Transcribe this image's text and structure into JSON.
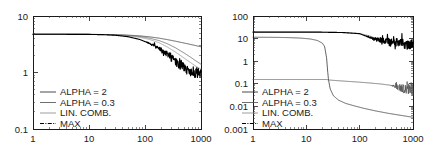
{
  "figure": {
    "background": "#ffffff",
    "panel_count": 2,
    "axis_color": "#1a1a1a"
  },
  "chart_data": [
    {
      "type": "line",
      "panel": "left",
      "title": "",
      "xlabel": "",
      "ylabel": "",
      "xscale": "log",
      "yscale": "log",
      "xlim": [
        1,
        1000
      ],
      "ylim": [
        0.1,
        10
      ],
      "xticks": [
        1,
        10,
        100,
        1000
      ],
      "xticklabels": [
        "1",
        "10",
        "100",
        "1000"
      ],
      "yticks": [
        0.1,
        1,
        10
      ],
      "yticklabels": [
        "0.1",
        "1",
        "10"
      ],
      "grid": false,
      "legend_position": "lower-left",
      "series": [
        {
          "name": "ALPHA = 2",
          "color": "#2b2b2b",
          "style": "solid",
          "x": [
            1,
            2,
            3,
            5,
            8,
            12,
            20,
            30,
            50,
            80,
            120,
            180,
            250,
            350,
            500,
            650,
            800,
            1000
          ],
          "y": [
            4.75,
            4.75,
            4.75,
            4.74,
            4.73,
            4.72,
            4.7,
            4.66,
            4.58,
            4.45,
            4.28,
            4.05,
            3.82,
            3.58,
            3.32,
            3.14,
            3.0,
            2.85
          ]
        },
        {
          "name": "ALPHA = 0.3",
          "color": "#555555",
          "style": "solid",
          "x": [
            1,
            2,
            3,
            5,
            8,
            12,
            20,
            30,
            50,
            80,
            120,
            180,
            250,
            350,
            500,
            650,
            800,
            1000
          ],
          "y": [
            4.75,
            4.75,
            4.75,
            4.74,
            4.73,
            4.72,
            4.69,
            4.64,
            4.52,
            4.33,
            4.06,
            3.66,
            3.23,
            2.74,
            2.21,
            1.87,
            1.62,
            1.4
          ]
        },
        {
          "name": "LIN. COMB.",
          "color": "#8c8c8c",
          "style": "solid",
          "x": [
            1,
            2,
            3,
            5,
            8,
            12,
            20,
            30,
            50,
            80,
            120,
            180,
            250,
            350,
            500,
            650,
            800,
            1000
          ],
          "y": [
            4.75,
            4.75,
            4.75,
            4.74,
            4.73,
            4.71,
            4.68,
            4.61,
            4.46,
            4.2,
            3.85,
            3.35,
            2.83,
            2.3,
            1.8,
            1.5,
            1.3,
            1.15
          ]
        },
        {
          "name": "MAX",
          "color": "#000000",
          "style": "noisy",
          "x": [
            1,
            2,
            3,
            5,
            8,
            12,
            20,
            30,
            50,
            80,
            110,
            150,
            200,
            260,
            330,
            420,
            520,
            640,
            780,
            900,
            1000
          ],
          "y": [
            4.75,
            4.75,
            4.75,
            4.74,
            4.73,
            4.71,
            4.66,
            4.56,
            4.3,
            3.85,
            3.4,
            2.9,
            2.4,
            2.0,
            1.62,
            1.33,
            1.14,
            1.02,
            0.95,
            0.93,
            0.95
          ],
          "noise_start_x": 100,
          "noise_amplitude": 0.16
        }
      ]
    },
    {
      "type": "line",
      "panel": "right",
      "title": "",
      "xlabel": "",
      "ylabel": "",
      "xscale": "log",
      "yscale": "log",
      "xlim": [
        1,
        1000
      ],
      "ylim": [
        0.001,
        100
      ],
      "xticks": [
        1,
        10,
        100,
        1000
      ],
      "xticklabels": [
        "1",
        "10",
        "100",
        "1000"
      ],
      "yticks": [
        0.001,
        0.01,
        0.1,
        1,
        10,
        100
      ],
      "yticklabels": [
        "0.001",
        "0.01",
        "0.1",
        "1",
        "10",
        "100"
      ],
      "grid": false,
      "legend_position": "lower-left",
      "series": [
        {
          "name": "ALPHA = 2",
          "color": "#2b2b2b",
          "style": "solid",
          "x": [
            1,
            2,
            3,
            5,
            8,
            12,
            16,
            20,
            22,
            24,
            25,
            26,
            28,
            32,
            40,
            55,
            80,
            120,
            200,
            350,
            600,
            1000
          ],
          "y": [
            11.5,
            11.4,
            11.3,
            11.0,
            10.5,
            9.6,
            8.3,
            6.3,
            4.5,
            1.4,
            0.4,
            0.155,
            0.06,
            0.03,
            0.019,
            0.0135,
            0.0105,
            0.0082,
            0.0063,
            0.0049,
            0.004,
            0.0033
          ]
        },
        {
          "name": "ALPHA = 0.3",
          "color": "#555555",
          "style": "noisy",
          "x": [
            1,
            5,
            12,
            20,
            24,
            25,
            26,
            30,
            40,
            60,
            100,
            160,
            250,
            380,
            520,
            680,
            850,
            1000
          ],
          "y": [
            0.155,
            0.155,
            0.155,
            0.155,
            0.155,
            0.152,
            0.148,
            0.144,
            0.137,
            0.128,
            0.118,
            0.108,
            0.098,
            0.086,
            0.072,
            0.06,
            0.052,
            0.048
          ],
          "noise_start_x": 380,
          "noise_amplitude": 0.5
        },
        {
          "name": "LIN. COMB.",
          "color": "#8c8c8c",
          "style": "solid",
          "x": [
            1,
            3,
            8,
            20,
            50,
            100,
            150,
            200,
            300,
            450,
            650,
            1000
          ],
          "y": [
            19.5,
            19.5,
            19.4,
            19.2,
            18.5,
            16.8,
            13.5,
            10.5,
            8.0,
            6.6,
            5.8,
            5.2
          ]
        },
        {
          "name": "MAX",
          "color": "#000000",
          "style": "noisy",
          "x": [
            1,
            3,
            8,
            20,
            50,
            100,
            130,
            170,
            230,
            320,
            450,
            620,
            820,
            1000
          ],
          "y": [
            19.5,
            19.5,
            19.4,
            19.2,
            18.5,
            16.5,
            13.0,
            10.2,
            8.3,
            7.0,
            6.2,
            5.7,
            5.3,
            5.1
          ],
          "noise_start_x": 120,
          "noise_amplitude": 0.42
        }
      ]
    }
  ],
  "legend": {
    "items": [
      {
        "label": "ALPHA = 2",
        "color": "#2b2b2b",
        "style": "solid"
      },
      {
        "label": "ALPHA = 0.3",
        "color": "#555555",
        "style": "solid"
      },
      {
        "label": "LIN. COMB.",
        "color": "#8c8c8c",
        "style": "solid"
      },
      {
        "label": "MAX",
        "color": "#000000",
        "style": "dashdot"
      }
    ]
  }
}
